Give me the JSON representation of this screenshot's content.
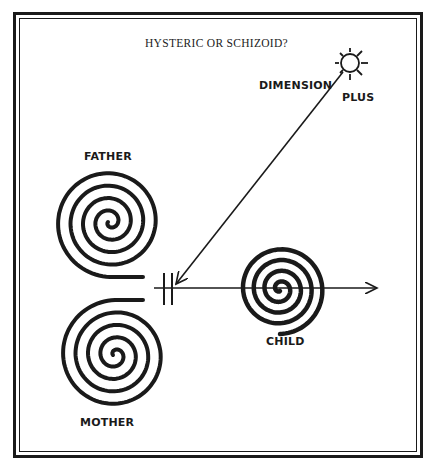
{
  "diagram": {
    "title": "HYSTERIC OR SCHIZOID?",
    "labels": {
      "dimension": "DIMENSION",
      "plus": "PLUS",
      "father": "FATHER",
      "mother": "MOTHER",
      "child": "CHILD"
    },
    "nodes": [
      {
        "id": "father",
        "shape": "spiral",
        "center": [
          110,
          222
        ],
        "radius": 55
      },
      {
        "id": "mother",
        "shape": "spiral",
        "center": [
          115,
          355
        ],
        "radius": 55
      },
      {
        "id": "child",
        "shape": "spiral",
        "center": [
          280,
          289
        ],
        "radius": 45
      },
      {
        "id": "dimension-plus",
        "shape": "sun",
        "center": [
          350,
          63
        ],
        "radius": 9
      }
    ],
    "edges": [
      {
        "from": "dimension-plus",
        "to": "barrier",
        "style": "arrow"
      },
      {
        "from": "barrier",
        "to": "right",
        "style": "arrow",
        "through": "child"
      }
    ],
    "barrier": {
      "symbol": "double-bar",
      "x": [
        163,
        172
      ],
      "y": 288
    },
    "colors": {
      "ink": "#1a1a1a",
      "background": "#ffffff"
    }
  }
}
